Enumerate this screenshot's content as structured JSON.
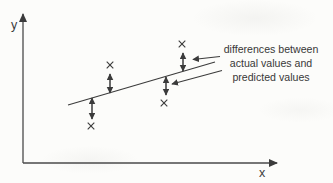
{
  "figure": {
    "title_hint": "scatter plot with fitted line showing residuals",
    "colors": {
      "ink": "#3b3b3b",
      "background": "#fcfcfa"
    },
    "axes": {
      "x_label": "x",
      "y_label": "y"
    },
    "annotation": {
      "lines": [
        "differences between",
        "actual values and",
        "predicted values"
      ]
    },
    "regression_line": {
      "x1": 68,
      "y1": 105,
      "x2": 215,
      "y2": 62
    },
    "data_points": [
      {
        "x": 110,
        "y": 65,
        "position": "above-line"
      },
      {
        "x": 182,
        "y": 44,
        "position": "above-line"
      },
      {
        "x": 91,
        "y": 126,
        "position": "below-line"
      },
      {
        "x": 164,
        "y": 103,
        "position": "below-line"
      }
    ],
    "residual_arrows": [
      {
        "x": 110,
        "y1": 74,
        "y2": 93
      },
      {
        "x": 183,
        "y1": 53,
        "y2": 71
      },
      {
        "x": 92,
        "y1": 98,
        "y2": 119
      },
      {
        "x": 166,
        "y1": 77,
        "y2": 95
      }
    ],
    "pointer_arrows": [
      {
        "x1": 220,
        "y1": 56.5,
        "x2": 193,
        "y2": 59.5
      },
      {
        "x1": 222,
        "y1": 70.5,
        "x2": 172,
        "y2": 84
      }
    ]
  }
}
